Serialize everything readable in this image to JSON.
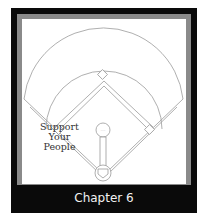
{
  "diagram": {
    "type": "baseball-field",
    "annotation": {
      "line1": "Support",
      "line2": "Your People"
    },
    "caption": "Chapter 6",
    "colors": {
      "border": "#0a0a0a",
      "inner_border": "#8a8a8a",
      "field_lines": "#9a9a9a",
      "caption_text": "#f2f2f2"
    }
  }
}
